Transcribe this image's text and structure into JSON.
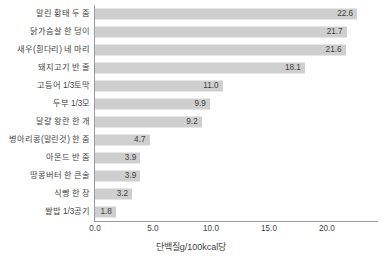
{
  "chart_data": {
    "type": "bar",
    "orientation": "horizontal",
    "title": "",
    "xlabel": "단백질g/100kcal당",
    "ylabel": "",
    "xlim": [
      0.0,
      24.4
    ],
    "xticks": [
      "0.0",
      "5.0",
      "10.0",
      "15.0",
      "20.0"
    ],
    "xtick_values": [
      0.0,
      5.0,
      10.0,
      15.0,
      20.0
    ],
    "grid": false,
    "legend": "none",
    "bar_color": "#cfcfcf",
    "axis_color": "#9a9a9a",
    "text_color": "#3f3f3f",
    "categories": [
      "말린 황태 두 줌",
      "닭가슴살 한 덩이",
      "새우(흰다리) 네 마리",
      "돼지고기 반 줄",
      "고등어 1/3토막",
      "두부 1/3모",
      "달걀 왕란 한 개",
      "병아리콩(말린것) 한 줌",
      "아몬드 반 줌",
      "땅콩버터 한 큰술",
      "식빵 한 장",
      "쌀밥 1/3공기"
    ],
    "values": [
      22.6,
      21.7,
      21.6,
      18.1,
      11.0,
      9.9,
      9.2,
      4.7,
      3.9,
      3.9,
      3.2,
      1.8
    ],
    "value_labels": [
      "22.6",
      "21.7",
      "21.6",
      "18.1",
      "11.0",
      "9.9",
      "9.2",
      "4.7",
      "3.9",
      "3.9",
      "3.2",
      "1.8"
    ]
  }
}
